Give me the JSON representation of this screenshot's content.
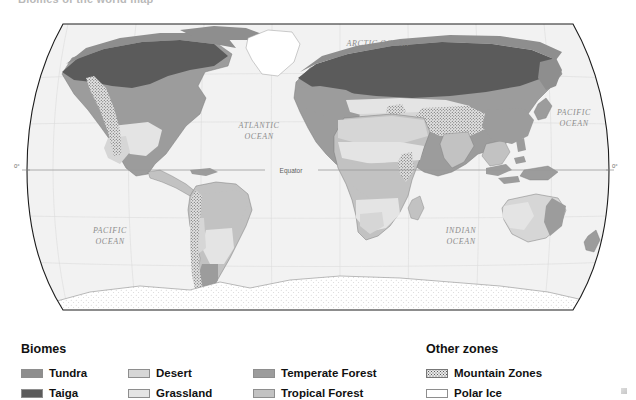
{
  "top_caption": "Biomes of the world map",
  "map": {
    "projection": "robinson",
    "background_color": "#f2f2f2",
    "outline_color": "#1c1c1c",
    "graticule_color": "#d2d2d2",
    "equator": {
      "label": "Equator",
      "left_tick": "0°",
      "right_tick": "0°"
    },
    "ocean_labels": [
      {
        "name": "arctic-ocean",
        "text": "ARCTIC  OCEAN",
        "x": 378,
        "y": 32
      },
      {
        "name": "atlantic-ocean",
        "text": "ATLANTIC",
        "x": 259,
        "y": 114
      },
      {
        "name": "atlantic-ocean",
        "text": "OCEAN",
        "x": 259,
        "y": 125
      },
      {
        "name": "pacific-ocean-e",
        "text": "PACIFIC",
        "x": 574,
        "y": 101
      },
      {
        "name": "pacific-ocean-e",
        "text": "OCEAN",
        "x": 574,
        "y": 112
      },
      {
        "name": "pacific-ocean-w",
        "text": "PACIFIC",
        "x": 110,
        "y": 219
      },
      {
        "name": "pacific-ocean-w",
        "text": "OCEAN",
        "x": 110,
        "y": 230
      },
      {
        "name": "indian-ocean",
        "text": "INDIAN",
        "x": 461,
        "y": 219
      },
      {
        "name": "indian-ocean",
        "text": "OCEAN",
        "x": 461,
        "y": 230
      }
    ]
  },
  "legend": {
    "biomes_heading": "Biomes",
    "other_heading": "Other zones",
    "biomes": [
      {
        "label": "Tundra",
        "color": "#8e8e8e",
        "pattern": "solid"
      },
      {
        "label": "Taiga",
        "color": "#5b5b5b",
        "pattern": "solid"
      },
      {
        "label": "Desert",
        "color": "#d6d6d6",
        "pattern": "solid"
      },
      {
        "label": "Grassland",
        "color": "#e4e4e4",
        "pattern": "solid"
      },
      {
        "label": "Temperate Forest",
        "color": "#9c9c9c",
        "pattern": "solid"
      },
      {
        "label": "Tropical Forest",
        "color": "#c2c2c2",
        "pattern": "solid"
      }
    ],
    "other_zones": [
      {
        "label": "Mountain Zones",
        "color": "#e8e8e8",
        "pattern": "stipple"
      },
      {
        "label": "Polar Ice",
        "color": "#ffffff",
        "pattern": "solid"
      }
    ]
  },
  "colors": {
    "tundra": "#8e8e8e",
    "taiga": "#5b5b5b",
    "desert": "#d6d6d6",
    "grassland": "#e4e4e4",
    "temperate_forest": "#9c9c9c",
    "tropical_forest": "#c2c2c2",
    "mountain": "#e8e8e8",
    "polar_ice": "#ffffff",
    "ocean": "#f2f2f2",
    "coastline": "#7a7a7a"
  }
}
